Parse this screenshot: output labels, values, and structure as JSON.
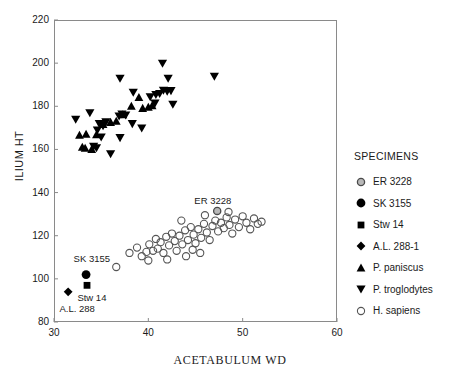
{
  "chart_data": {
    "type": "scatter",
    "title": "",
    "xlabel": "ACETABULUM WD",
    "ylabel": "ILIUM HT",
    "xlim": [
      30,
      60
    ],
    "ylim": [
      80,
      220
    ],
    "xticks": [
      30,
      40,
      50,
      60
    ],
    "yticks": [
      80,
      100,
      120,
      140,
      160,
      180,
      200,
      220
    ],
    "grid": false,
    "legend_position": "right-outside",
    "legend_title": "SPECIMENS",
    "series": [
      {
        "name": "ER 3228",
        "marker": "shaded-circle",
        "points": [
          [
            47.3,
            131.5
          ]
        ]
      },
      {
        "name": "SK 3155",
        "marker": "filled-circle",
        "points": [
          [
            33.4,
            102.0
          ]
        ]
      },
      {
        "name": "Stw 14",
        "marker": "filled-square",
        "points": [
          [
            33.5,
            97.0
          ]
        ]
      },
      {
        "name": "A.L. 288-1",
        "marker": "filled-diamond",
        "points": [
          [
            31.5,
            94.0
          ]
        ]
      },
      {
        "name": "P. paniscus",
        "marker": "filled-up-triangle",
        "points": [
          [
            32.7,
            166.5
          ],
          [
            33.4,
            167.0
          ],
          [
            34.5,
            166.8
          ],
          [
            33.0,
            161.0
          ],
          [
            33.3,
            160.5
          ],
          [
            34.0,
            160.0
          ],
          [
            36.0,
            172.5
          ],
          [
            36.6,
            173.0
          ],
          [
            37.3,
            176.0
          ],
          [
            38.2,
            180.0
          ],
          [
            39.4,
            179.0
          ],
          [
            40.0,
            179.5
          ],
          [
            40.4,
            180.2
          ],
          [
            39.0,
            184.0
          ],
          [
            35.2,
            171.5
          ]
        ]
      },
      {
        "name": "P. troglodytes",
        "marker": "filled-down-triangle",
        "points": [
          [
            32.3,
            174.0
          ],
          [
            33.8,
            177.0
          ],
          [
            34.8,
            172.0
          ],
          [
            35.2,
            171.0
          ],
          [
            35.5,
            172.8
          ],
          [
            34.6,
            169.0
          ],
          [
            35.0,
            165.8
          ],
          [
            36.0,
            158.0
          ],
          [
            36.9,
            175.5
          ],
          [
            37.2,
            176.5
          ],
          [
            37.6,
            176.0
          ],
          [
            37.0,
            165.5
          ],
          [
            38.3,
            172.0
          ],
          [
            39.3,
            170.0
          ],
          [
            37.0,
            193.0
          ],
          [
            38.4,
            186.5
          ],
          [
            40.2,
            184.5
          ],
          [
            40.8,
            185.5
          ],
          [
            41.2,
            186.0
          ],
          [
            41.6,
            187.5
          ],
          [
            42.0,
            187.0
          ],
          [
            42.4,
            187.3
          ],
          [
            41.5,
            200.0
          ],
          [
            42.1,
            193.0
          ],
          [
            42.6,
            181.0
          ],
          [
            47.0,
            194.0
          ],
          [
            40.7,
            181.5
          ],
          [
            34.2,
            161.5
          ],
          [
            34.5,
            160.8
          ]
        ]
      },
      {
        "name": "H. sapiens",
        "marker": "open-circle",
        "points": [
          [
            36.6,
            105.5
          ],
          [
            38.0,
            112.0
          ],
          [
            38.8,
            114.5
          ],
          [
            39.3,
            110.5
          ],
          [
            39.8,
            112.5
          ],
          [
            40.1,
            116.0
          ],
          [
            40.5,
            113.0
          ],
          [
            40.8,
            118.5
          ],
          [
            41.0,
            114.0
          ],
          [
            41.3,
            117.0
          ],
          [
            41.6,
            112.0
          ],
          [
            41.9,
            119.5
          ],
          [
            42.2,
            115.5
          ],
          [
            42.5,
            121.0
          ],
          [
            42.8,
            117.5
          ],
          [
            43.0,
            113.0
          ],
          [
            43.3,
            120.0
          ],
          [
            43.6,
            116.0
          ],
          [
            43.9,
            122.5
          ],
          [
            44.2,
            118.0
          ],
          [
            44.5,
            124.0
          ],
          [
            44.8,
            120.5
          ],
          [
            45.0,
            116.5
          ],
          [
            45.3,
            123.0
          ],
          [
            45.6,
            119.0
          ],
          [
            45.9,
            125.5
          ],
          [
            46.2,
            121.5
          ],
          [
            46.5,
            118.0
          ],
          [
            46.8,
            124.5
          ],
          [
            47.1,
            127.0
          ],
          [
            47.4,
            122.0
          ],
          [
            47.7,
            126.0
          ],
          [
            48.0,
            123.5
          ],
          [
            48.3,
            128.5
          ],
          [
            48.6,
            125.0
          ],
          [
            48.9,
            121.0
          ],
          [
            49.2,
            127.5
          ],
          [
            49.6,
            124.0
          ],
          [
            50.0,
            129.0
          ],
          [
            50.4,
            126.0
          ],
          [
            50.8,
            123.0
          ],
          [
            51.2,
            128.0
          ],
          [
            51.6,
            125.5
          ],
          [
            52.0,
            126.5
          ],
          [
            44.0,
            110.5
          ],
          [
            45.5,
            112.0
          ],
          [
            42.0,
            109.0
          ],
          [
            43.5,
            127.0
          ],
          [
            46.0,
            129.5
          ],
          [
            48.5,
            131.0
          ],
          [
            44.7,
            113.5
          ],
          [
            40.0,
            108.5
          ]
        ]
      }
    ],
    "annotations": [
      {
        "text": "ER 3228",
        "x": 47.0,
        "y": 136.0
      },
      {
        "text": "SK 3155",
        "x": 34.2,
        "y": 109.0
      },
      {
        "text": "Stw 14",
        "x": 34.6,
        "y": 91.0
      },
      {
        "text": "A.L. 288",
        "x": 32.7,
        "y": 86.0
      }
    ]
  },
  "legend": {
    "title": "SPECIMENS",
    "items": [
      {
        "label": "ER 3228",
        "marker": "shaded-circle"
      },
      {
        "label": "SK 3155",
        "marker": "filled-circle"
      },
      {
        "label": "Stw 14",
        "marker": "filled-square"
      },
      {
        "label": "A.L. 288-1",
        "marker": "filled-diamond"
      },
      {
        "label": "P. paniscus",
        "marker": "filled-up-triangle"
      },
      {
        "label": "P. troglodytes",
        "marker": "filled-down-triangle"
      },
      {
        "label": "H. sapiens",
        "marker": "open-circle"
      }
    ]
  },
  "colors": {
    "marker_fill": "#000000",
    "marker_stroke": "#555555",
    "axis": "#8a8a8a",
    "text": "#1a1a1a",
    "background": "#ffffff"
  }
}
